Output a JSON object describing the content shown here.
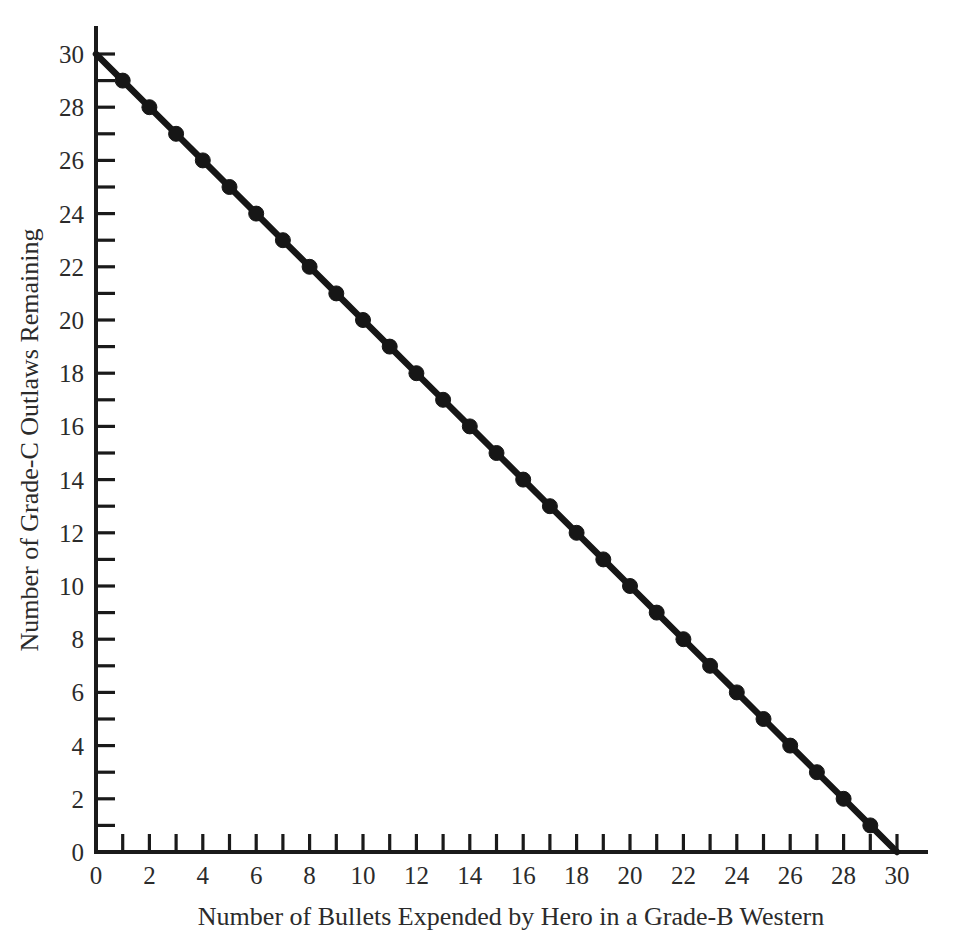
{
  "chart_data": {
    "type": "line",
    "title": "",
    "subtitle": "",
    "xlabel": "Number of Bullets Expended by Hero in a Grade-B Western",
    "ylabel": "Number of Grade-C Outlaws Remaining",
    "xlim": [
      0,
      30
    ],
    "ylim": [
      0,
      30
    ],
    "grid": false,
    "legend": null,
    "legend_position": "none",
    "x_major_ticks": [
      0,
      2,
      4,
      6,
      8,
      10,
      12,
      14,
      16,
      18,
      20,
      22,
      24,
      26,
      28,
      30
    ],
    "x_minor_ticks": [
      1,
      3,
      5,
      7,
      9,
      11,
      13,
      15,
      17,
      19,
      21,
      23,
      25,
      27,
      29
    ],
    "x_tick_labels": [
      "0",
      "2",
      "4",
      "6",
      "8",
      "10",
      "12",
      "14",
      "16",
      "18",
      "20",
      "22",
      "24",
      "26",
      "28",
      "30"
    ],
    "y_major_ticks": [
      0,
      2,
      4,
      6,
      8,
      10,
      12,
      14,
      16,
      18,
      20,
      22,
      24,
      26,
      28,
      30
    ],
    "y_minor_ticks": [
      1,
      3,
      5,
      7,
      9,
      11,
      13,
      15,
      17,
      19,
      21,
      23,
      25,
      27,
      29
    ],
    "y_tick_labels": [
      "0",
      "2",
      "4",
      "6",
      "8",
      "10",
      "12",
      "14",
      "16",
      "18",
      "20",
      "22",
      "24",
      "26",
      "28",
      "30"
    ],
    "tick_direction": "in",
    "series": [
      {
        "name": "Outlaws Remaining",
        "color": "#161616",
        "marker": "filled-circle",
        "marker_x_values": [
          1,
          2,
          3,
          4,
          5,
          6,
          7,
          8,
          9,
          10,
          11,
          12,
          13,
          14,
          15,
          16,
          17,
          18,
          19,
          20,
          21,
          22,
          23,
          24,
          25,
          26,
          27,
          28,
          29
        ],
        "marker_y_values": [
          29,
          28,
          27,
          26,
          25,
          24,
          23,
          22,
          21,
          20,
          19,
          18,
          17,
          16,
          15,
          14,
          13,
          12,
          11,
          10,
          9,
          8,
          7,
          6,
          5,
          4,
          3,
          2,
          1
        ],
        "x": [
          0,
          1,
          2,
          3,
          4,
          5,
          6,
          7,
          8,
          9,
          10,
          11,
          12,
          13,
          14,
          15,
          16,
          17,
          18,
          19,
          20,
          21,
          22,
          23,
          24,
          25,
          26,
          27,
          28,
          29,
          30
        ],
        "values": [
          30,
          29,
          28,
          27,
          26,
          25,
          24,
          23,
          22,
          21,
          20,
          19,
          18,
          17,
          16,
          15,
          14,
          13,
          12,
          11,
          10,
          9,
          8,
          7,
          6,
          5,
          4,
          3,
          2,
          1,
          0
        ]
      }
    ]
  },
  "figure": {
    "background_color": "#ffffff",
    "foreground_color": "#1a1a1a"
  }
}
